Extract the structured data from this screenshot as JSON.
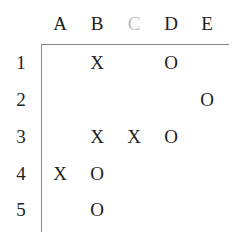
{
  "columns": [
    {
      "label": "A",
      "x": 60,
      "color": "#222222"
    },
    {
      "label": "B",
      "x": 97,
      "color": "#222222"
    },
    {
      "label": "C",
      "x": 134,
      "color": "#bbbbbb"
    },
    {
      "label": "D",
      "x": 171,
      "color": "#222222"
    },
    {
      "label": "E",
      "x": 207,
      "color": "#222222"
    }
  ],
  "rows": [
    {
      "label": "1",
      "y": 62
    },
    {
      "label": "2",
      "y": 99
    },
    {
      "label": "3",
      "y": 136
    },
    {
      "label": "4",
      "y": 173
    },
    {
      "label": "5",
      "y": 209
    }
  ],
  "cells": [
    {
      "row": 0,
      "col": 1,
      "mark": "X"
    },
    {
      "row": 0,
      "col": 3,
      "mark": "O"
    },
    {
      "row": 1,
      "col": 4,
      "mark": "O"
    },
    {
      "row": 2,
      "col": 1,
      "mark": "X"
    },
    {
      "row": 2,
      "col": 2,
      "mark": "X"
    },
    {
      "row": 2,
      "col": 3,
      "mark": "O"
    },
    {
      "row": 3,
      "col": 0,
      "mark": "X"
    },
    {
      "row": 3,
      "col": 1,
      "mark": "O"
    },
    {
      "row": 4,
      "col": 1,
      "mark": "O"
    }
  ]
}
